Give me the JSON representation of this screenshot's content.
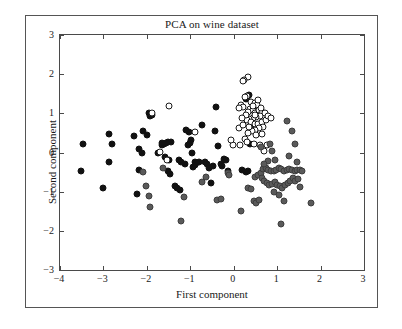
{
  "chart_data": {
    "type": "scatter",
    "title": "PCA on wine dataset",
    "xlabel": "First component",
    "ylabel": "Second component",
    "xlim": [
      -4,
      3
    ],
    "ylim": [
      -3,
      3
    ],
    "xticks": [
      -4,
      -3,
      -2,
      -1,
      0,
      1,
      2,
      3
    ],
    "xticklabels": [
      "−4",
      "−3",
      "−2",
      "−1",
      "0",
      "1",
      "2",
      "3"
    ],
    "yticks": [
      -3,
      -2,
      -1,
      0,
      1,
      2,
      3
    ],
    "yticklabels": [
      "−3",
      "−2",
      "−1",
      "0",
      "1",
      "2",
      "3"
    ],
    "grid": false,
    "legend": null,
    "marker_size_px": 7,
    "classes": [
      {
        "name": "class-0",
        "style": "filled-black",
        "color": "#111111"
      },
      {
        "name": "class-1",
        "style": "open-white",
        "color": "#ffffff",
        "edge": "#1a1a1a"
      },
      {
        "name": "class-2",
        "style": "filled-gray",
        "color": "#5a5a5a",
        "edge": "#3d3d3d"
      }
    ],
    "series": [
      {
        "name": "class-0",
        "class_index": 0,
        "points": [
          [
            -3.46,
            0.21
          ],
          [
            -3.52,
            -0.46
          ],
          [
            -3.02,
            -0.9
          ],
          [
            -2.88,
            0.46
          ],
          [
            -2.8,
            0.22
          ],
          [
            -2.88,
            -0.24
          ],
          [
            -2.3,
            0.41
          ],
          [
            -2.18,
            0.1
          ],
          [
            -2.08,
            0.56
          ],
          [
            -2.18,
            -0.45
          ],
          [
            -2.12,
            -0.01
          ],
          [
            -2.22,
            -1.06
          ],
          [
            -1.94,
            1.0
          ],
          [
            -1.88,
            0.97
          ],
          [
            -1.92,
            0.93
          ],
          [
            -1.66,
            0.19
          ],
          [
            -1.6,
            0.22
          ],
          [
            -1.52,
            0.27
          ],
          [
            -1.44,
            0.28
          ],
          [
            -1.58,
            -0.12
          ],
          [
            -1.5,
            -0.2
          ],
          [
            -1.52,
            -0.48
          ],
          [
            -1.46,
            -0.55
          ],
          [
            -1.26,
            -0.18
          ],
          [
            -1.22,
            -0.25
          ],
          [
            -1.3,
            -0.9
          ],
          [
            -1.24,
            -0.96
          ],
          [
            -1.1,
            0.58
          ],
          [
            -1.02,
            0.53
          ],
          [
            -1.06,
            0.18
          ],
          [
            -1.0,
            0.24
          ],
          [
            -0.98,
            0.32
          ],
          [
            -0.96,
            -0.02
          ],
          [
            -0.9,
            -0.24
          ],
          [
            -0.86,
            -0.28
          ],
          [
            -0.88,
            -0.32
          ],
          [
            -0.8,
            -0.25
          ],
          [
            -0.72,
            0.71
          ],
          [
            -0.66,
            -0.24
          ],
          [
            -0.62,
            -0.3
          ],
          [
            -0.58,
            -0.4
          ],
          [
            -0.52,
            -0.78
          ],
          [
            -0.44,
            0.55
          ],
          [
            -0.4,
            1.15
          ],
          [
            -0.36,
            0.17
          ],
          [
            -0.3,
            -0.29
          ],
          [
            -0.22,
            -0.17
          ],
          [
            -0.18,
            -0.2
          ],
          [
            -0.14,
            -0.46
          ],
          [
            -0.26,
            -0.34
          ],
          [
            0.36,
            1.46
          ],
          [
            0.3,
            1.4
          ],
          [
            0.28,
            1.37
          ],
          [
            0.4,
            0.62
          ],
          [
            0.44,
            0.58
          ],
          [
            0.38,
            0.21
          ],
          [
            0.34,
            -0.46
          ],
          [
            0.28,
            -0.5
          ],
          [
            -1.64,
            0.24
          ],
          [
            -1.56,
            0.25
          ],
          [
            -1.12,
            -0.3
          ],
          [
            -0.94,
            -0.36
          ],
          [
            -1.74,
            -0.02
          ],
          [
            -2.0,
            0.44
          ],
          [
            0.46,
            0.6
          ],
          [
            0.2,
            -0.44
          ],
          [
            -0.48,
            -0.34
          ],
          [
            -1.36,
            -0.86
          ]
        ]
      },
      {
        "name": "class-1",
        "class_index": 1,
        "points": [
          [
            0.34,
            1.92
          ],
          [
            0.24,
            1.86
          ],
          [
            0.22,
            1.82
          ],
          [
            0.3,
            1.45
          ],
          [
            0.26,
            1.42
          ],
          [
            0.16,
            1.22
          ],
          [
            0.22,
            1.16
          ],
          [
            0.12,
            1.14
          ],
          [
            0.4,
            1.3
          ],
          [
            0.48,
            1.26
          ],
          [
            0.54,
            1.22
          ],
          [
            0.38,
            1.1
          ],
          [
            0.44,
            1.08
          ],
          [
            0.34,
            1.04
          ],
          [
            0.5,
            1.0
          ],
          [
            0.58,
            1.08
          ],
          [
            0.66,
            1.04
          ],
          [
            0.72,
            1.0
          ],
          [
            0.6,
            0.92
          ],
          [
            0.52,
            0.9
          ],
          [
            0.44,
            0.88
          ],
          [
            0.36,
            0.86
          ],
          [
            0.3,
            0.82
          ],
          [
            0.4,
            0.78
          ],
          [
            0.48,
            0.74
          ],
          [
            0.56,
            0.72
          ],
          [
            0.64,
            0.78
          ],
          [
            0.74,
            0.84
          ],
          [
            0.8,
            0.94
          ],
          [
            0.86,
            0.88
          ],
          [
            0.68,
            0.66
          ],
          [
            0.58,
            0.62
          ],
          [
            0.5,
            0.58
          ],
          [
            0.42,
            0.54
          ],
          [
            0.34,
            0.5
          ],
          [
            0.26,
            0.34
          ],
          [
            0.3,
            0.26
          ],
          [
            0.46,
            0.22
          ],
          [
            0.6,
            0.2
          ],
          [
            0.76,
            0.18
          ],
          [
            0.7,
            0.04
          ],
          [
            0.14,
            0.18
          ],
          [
            -0.02,
            0.2
          ],
          [
            -0.9,
            0.52
          ],
          [
            -1.48,
            1.18
          ],
          [
            -1.88,
            1.0
          ],
          [
            -1.7,
            0.02
          ],
          [
            -1.54,
            -0.2
          ],
          [
            -0.06,
            0.32
          ],
          [
            0.12,
            0.62
          ],
          [
            0.52,
            0.44
          ],
          [
            0.66,
            0.46
          ],
          [
            0.22,
            0.7
          ],
          [
            0.28,
            0.96
          ],
          [
            0.56,
            1.34
          ],
          [
            0.44,
            1.18
          ],
          [
            0.62,
            1.14
          ],
          [
            0.36,
            0.66
          ],
          [
            0.48,
            0.96
          ],
          [
            0.2,
            0.88
          ]
        ]
      },
      {
        "name": "class-2",
        "class_index": 2,
        "points": [
          [
            -2.1,
            -0.5
          ],
          [
            -2.02,
            -0.86
          ],
          [
            -1.96,
            -1.1
          ],
          [
            -1.92,
            -1.38
          ],
          [
            -1.62,
            -0.4
          ],
          [
            -1.22,
            -1.74
          ],
          [
            -1.14,
            -1.14
          ],
          [
            -0.72,
            -0.76
          ],
          [
            -0.64,
            -0.62
          ],
          [
            -0.38,
            -1.22
          ],
          [
            -0.3,
            -1.18
          ],
          [
            -0.14,
            -0.52
          ],
          [
            -0.1,
            -0.58
          ],
          [
            0.16,
            -1.5
          ],
          [
            0.34,
            -0.9
          ],
          [
            0.4,
            -0.94
          ],
          [
            0.46,
            -1.24
          ],
          [
            0.52,
            -1.28
          ],
          [
            0.58,
            -1.22
          ],
          [
            0.5,
            -0.62
          ],
          [
            0.56,
            -0.58
          ],
          [
            0.62,
            -0.52
          ],
          [
            0.68,
            -0.42
          ],
          [
            0.74,
            -0.4
          ],
          [
            0.8,
            -0.44
          ],
          [
            0.86,
            -0.46
          ],
          [
            0.92,
            -0.48
          ],
          [
            0.98,
            -0.44
          ],
          [
            1.04,
            -0.4
          ],
          [
            1.1,
            -0.42
          ],
          [
            1.16,
            -0.46
          ],
          [
            1.22,
            -0.44
          ],
          [
            1.28,
            -0.42
          ],
          [
            1.34,
            -0.44
          ],
          [
            1.4,
            -0.48
          ],
          [
            1.46,
            -0.44
          ],
          [
            0.64,
            -0.66
          ],
          [
            0.7,
            -0.72
          ],
          [
            0.76,
            -0.78
          ],
          [
            0.82,
            -0.84
          ],
          [
            0.88,
            -0.8
          ],
          [
            0.94,
            -0.76
          ],
          [
            1.0,
            -0.82
          ],
          [
            1.06,
            -0.86
          ],
          [
            1.12,
            -0.9
          ],
          [
            1.18,
            -0.84
          ],
          [
            1.24,
            -0.78
          ],
          [
            1.3,
            -0.74
          ],
          [
            0.92,
            -1.02
          ],
          [
            1.04,
            -1.08
          ],
          [
            1.16,
            -1.24
          ],
          [
            1.36,
            -0.66
          ],
          [
            1.42,
            -0.72
          ],
          [
            1.48,
            -0.68
          ],
          [
            1.52,
            -0.88
          ],
          [
            1.46,
            -0.24
          ],
          [
            1.4,
            0.22
          ],
          [
            1.34,
            0.56
          ],
          [
            1.28,
            -0.08
          ],
          [
            1.22,
            0.8
          ],
          [
            1.1,
            -1.82
          ],
          [
            1.78,
            -1.3
          ],
          [
            0.88,
            0.04
          ],
          [
            0.96,
            -0.18
          ],
          [
            0.78,
            -0.22
          ],
          [
            0.7,
            -0.3
          ],
          [
            0.62,
            0.14
          ],
          [
            0.84,
            0.22
          ],
          [
            1.52,
            -0.44
          ],
          [
            1.58,
            -0.46
          ]
        ]
      }
    ]
  },
  "figure": {
    "border_color": "#555555",
    "axes_color": "#4a4a4a",
    "background": "#ffffff"
  }
}
